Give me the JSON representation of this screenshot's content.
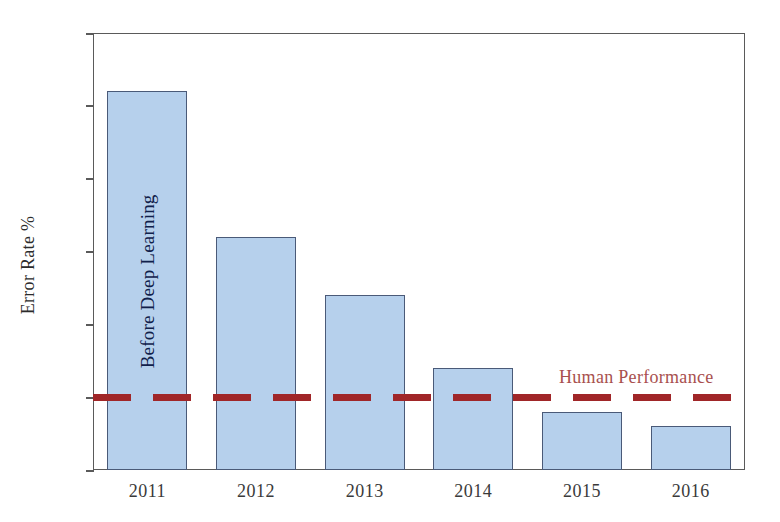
{
  "chart_data": {
    "type": "bar",
    "title": "",
    "subtitle": "",
    "xlabel": "",
    "ylabel": "Error Rate %",
    "categories": [
      "2011",
      "2012",
      "2013",
      "2014",
      "2015",
      "2016"
    ],
    "values": [
      26,
      16,
      12,
      7,
      4,
      3
    ],
    "series": [
      {
        "name": "ImageNet classification error rate",
        "values": [
          26,
          16,
          12,
          7,
          4,
          3
        ]
      }
    ],
    "ylim": [
      0,
      30
    ],
    "y_ticks": [
      0,
      5,
      10,
      15,
      20,
      25,
      30
    ],
    "y_tick_labels": [
      "0",
      "5",
      "10",
      "15",
      "20",
      "25",
      "30"
    ],
    "grid": false,
    "legend": "none",
    "bar_fill_color": "#b6d0ec",
    "bar_edge_color": "#4a5a78",
    "annotations": [
      {
        "name": "before-deep-learning",
        "text": "Before Deep Learning",
        "orientation": "vertical",
        "attached_to_category": "2011",
        "color": "#10204a"
      },
      {
        "name": "human-performance",
        "text": "Human Performance",
        "color": "#a8504e"
      }
    ],
    "reference_lines": [
      {
        "name": "human-performance-threshold",
        "label": "Human Performance",
        "value": 5,
        "style": "dashed",
        "color": "#a02628"
      }
    ]
  }
}
